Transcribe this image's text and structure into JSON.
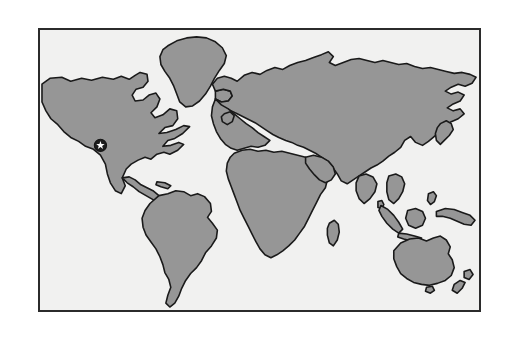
{
  "figure": {
    "kind": "world-map-figure",
    "title": "",
    "caption": "",
    "outer_background": "#ffffff"
  },
  "map": {
    "projection_hint": "equirectangular",
    "frame": {
      "x": 38,
      "y": 28,
      "width": 443,
      "height": 284,
      "border_color": "#2b2b2b",
      "border_width": 2
    },
    "ocean_color": "#f1f1f0",
    "land_fill": "#969696",
    "land_outline": "#1a1a1a",
    "labels": [],
    "graticule": false,
    "legend": null
  },
  "markers": [
    {
      "name": "location-star-marker",
      "shape": "star-in-circle",
      "x": 101,
      "y": 147,
      "radius": 6.2,
      "disc_color": "#1c1c1c",
      "star_color": "#ffffff",
      "label": "",
      "region_hint": "southwestern North America"
    }
  ],
  "landmasses": [
    {
      "name": "north-america"
    },
    {
      "name": "south-america"
    },
    {
      "name": "greenland"
    },
    {
      "name": "iceland"
    },
    {
      "name": "eurasia"
    },
    {
      "name": "africa"
    },
    {
      "name": "british-isles"
    },
    {
      "name": "japan"
    },
    {
      "name": "sumatra"
    },
    {
      "name": "borneo"
    },
    {
      "name": "java"
    },
    {
      "name": "new-guinea"
    },
    {
      "name": "australia"
    },
    {
      "name": "new-zealand"
    },
    {
      "name": "madagascar"
    },
    {
      "name": "sri-lanka"
    },
    {
      "name": "cuba"
    }
  ]
}
